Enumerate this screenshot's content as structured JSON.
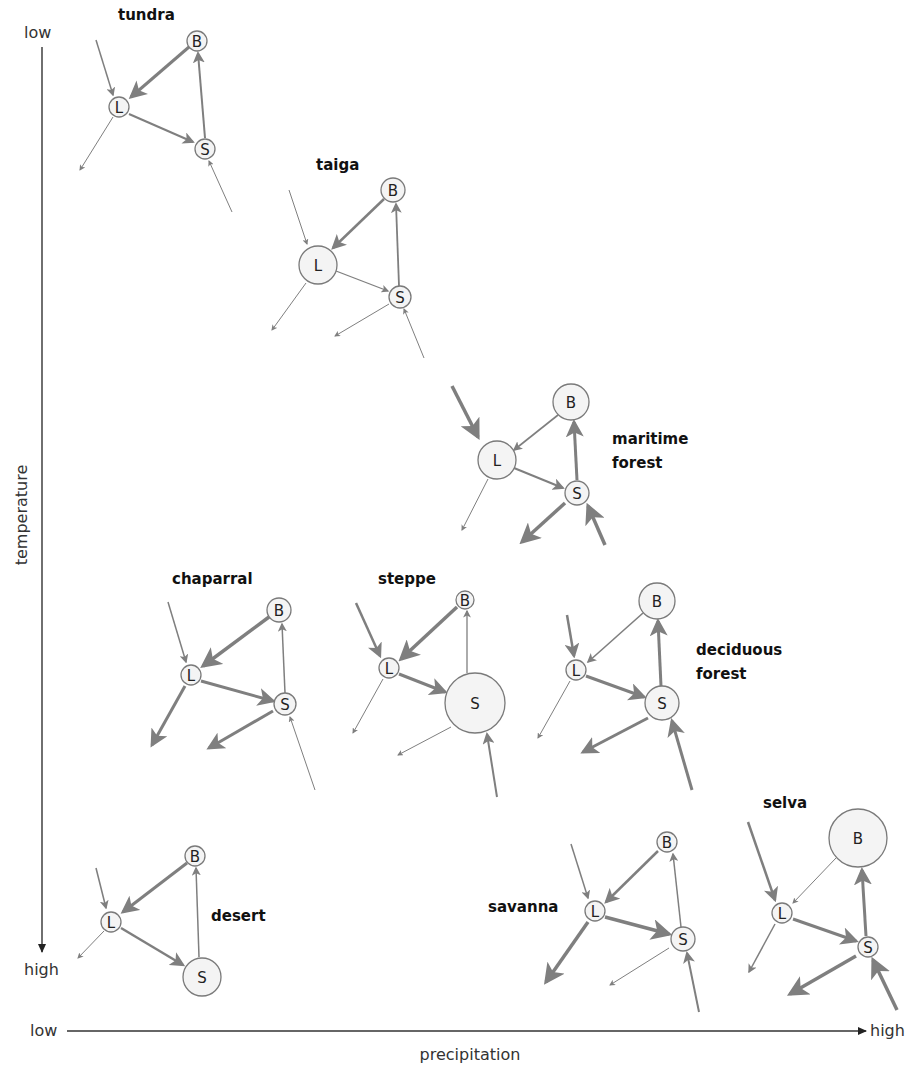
{
  "axes": {
    "y_label": "temperature",
    "y_low": "low",
    "y_high": "high",
    "x_label": "precipitation",
    "x_low": "low",
    "x_high": "high"
  },
  "node_labels": {
    "L": "L",
    "B": "B",
    "S": "S"
  },
  "biomes": [
    {
      "name": "tundra",
      "label": [
        "tundra"
      ],
      "label_pos": [
        118,
        20
      ],
      "nodes": {
        "L": [
          119,
          107,
          10
        ],
        "B": [
          197,
          41,
          10
        ],
        "S": [
          205,
          149,
          10
        ]
      },
      "flows": [
        {
          "from": [
            96,
            40
          ],
          "to": [
            113,
            95
          ],
          "w": 1.5
        },
        {
          "from": [
            189,
            47
          ],
          "to": [
            131,
            97
          ],
          "w": 3
        },
        {
          "from": [
            129,
            114
          ],
          "to": [
            193,
            142
          ],
          "w": 2
        },
        {
          "from": [
            205,
            138
          ],
          "to": [
            198,
            53
          ],
          "w": 2
        },
        {
          "from": [
            113,
            117
          ],
          "to": [
            80,
            170
          ],
          "w": 1
        },
        {
          "from": [
            232,
            212
          ],
          "to": [
            209,
            161
          ],
          "w": 1
        }
      ]
    },
    {
      "name": "taiga",
      "label": [
        "taiga"
      ],
      "label_pos": [
        316,
        170
      ],
      "nodes": {
        "L": [
          318,
          265,
          19
        ],
        "B": [
          393,
          190,
          12
        ],
        "S": [
          400,
          297,
          11
        ]
      },
      "flows": [
        {
          "from": [
            289,
            190
          ],
          "to": [
            307,
            244
          ],
          "w": 1
        },
        {
          "from": [
            384,
            199
          ],
          "to": [
            333,
            248
          ],
          "w": 2.5
        },
        {
          "from": [
            336,
            271
          ],
          "to": [
            388,
            291
          ],
          "w": 1.3
        },
        {
          "from": [
            399,
            286
          ],
          "to": [
            396,
            204
          ],
          "w": 1.8
        },
        {
          "from": [
            306,
            283
          ],
          "to": [
            272,
            330
          ],
          "w": 1
        },
        {
          "from": [
            389,
            304
          ],
          "to": [
            335,
            336
          ],
          "w": 1
        },
        {
          "from": [
            424,
            358
          ],
          "to": [
            404,
            309
          ],
          "w": 1
        }
      ]
    },
    {
      "name": "maritime forest",
      "label": [
        "maritime",
        "forest"
      ],
      "label_pos": [
        612,
        444
      ],
      "nodes": {
        "L": [
          497,
          460,
          19
        ],
        "B": [
          571,
          402,
          18
        ],
        "S": [
          577,
          493,
          12
        ]
      },
      "flows": [
        {
          "from": [
            452,
            386
          ],
          "to": [
            478,
            437
          ],
          "w": 3.5
        },
        {
          "from": [
            558,
            415
          ],
          "to": [
            514,
            450
          ],
          "w": 1.6
        },
        {
          "from": [
            514,
            468
          ],
          "to": [
            563,
            488
          ],
          "w": 2
        },
        {
          "from": [
            577,
            480
          ],
          "to": [
            574,
            422
          ],
          "w": 3
        },
        {
          "from": [
            488,
            479
          ],
          "to": [
            462,
            530
          ],
          "w": 1
        },
        {
          "from": [
            565,
            503
          ],
          "to": [
            522,
            542
          ],
          "w": 3.5
        },
        {
          "from": [
            605,
            545
          ],
          "to": [
            588,
            506
          ],
          "w": 3.5
        }
      ]
    },
    {
      "name": "chaparral",
      "label": [
        "chaparral"
      ],
      "label_pos": [
        172,
        584
      ],
      "nodes": {
        "L": [
          191,
          675,
          10
        ],
        "B": [
          279,
          610,
          12
        ],
        "S": [
          285,
          704,
          11
        ]
      },
      "flows": [
        {
          "from": [
            168,
            602
          ],
          "to": [
            186,
            662
          ],
          "w": 1.5
        },
        {
          "from": [
            269,
            617
          ],
          "to": [
            203,
            666
          ],
          "w": 3.5
        },
        {
          "from": [
            201,
            681
          ],
          "to": [
            273,
            701
          ],
          "w": 3
        },
        {
          "from": [
            285,
            693
          ],
          "to": [
            282,
            624
          ],
          "w": 1.5
        },
        {
          "from": [
            185,
            686
          ],
          "to": [
            152,
            745
          ],
          "w": 3
        },
        {
          "from": [
            273,
            711
          ],
          "to": [
            209,
            748
          ],
          "w": 3
        },
        {
          "from": [
            315,
            790
          ],
          "to": [
            290,
            717
          ],
          "w": 1
        }
      ]
    },
    {
      "name": "steppe",
      "label": [
        "steppe"
      ],
      "label_pos": [
        378,
        584
      ],
      "nodes": {
        "L": [
          389,
          668,
          10
        ],
        "B": [
          465,
          600,
          9
        ],
        "S": [
          475,
          703,
          30
        ]
      },
      "flows": [
        {
          "from": [
            356,
            603
          ],
          "to": [
            380,
            656
          ],
          "w": 2.5
        },
        {
          "from": [
            457,
            607
          ],
          "to": [
            401,
            659
          ],
          "w": 3.5
        },
        {
          "from": [
            399,
            674
          ],
          "to": [
            445,
            692
          ],
          "w": 3
        },
        {
          "from": [
            467,
            673
          ],
          "to": [
            467,
            611
          ],
          "w": 1.3
        },
        {
          "from": [
            383,
            679
          ],
          "to": [
            353,
            733
          ],
          "w": 1
        },
        {
          "from": [
            451,
            727
          ],
          "to": [
            398,
            755
          ],
          "w": 1
        },
        {
          "from": [
            497,
            797
          ],
          "to": [
            487,
            734
          ],
          "w": 2
        }
      ]
    },
    {
      "name": "deciduous forest",
      "label": [
        "deciduous",
        "forest"
      ],
      "label_pos": [
        696,
        655
      ],
      "nodes": {
        "L": [
          576,
          670,
          10
        ],
        "B": [
          657,
          601,
          18
        ],
        "S": [
          662,
          703,
          17
        ]
      },
      "flows": [
        {
          "from": [
            567,
            615
          ],
          "to": [
            574,
            656
          ],
          "w": 2.5
        },
        {
          "from": [
            643,
            613
          ],
          "to": [
            588,
            662
          ],
          "w": 1.6
        },
        {
          "from": [
            586,
            676
          ],
          "to": [
            644,
            697
          ],
          "w": 3
        },
        {
          "from": [
            661,
            686
          ],
          "to": [
            658,
            621
          ],
          "w": 3
        },
        {
          "from": [
            570,
            681
          ],
          "to": [
            538,
            738
          ],
          "w": 1
        },
        {
          "from": [
            648,
            718
          ],
          "to": [
            583,
            752
          ],
          "w": 3
        },
        {
          "from": [
            692,
            790
          ],
          "to": [
            672,
            721
          ],
          "w": 3
        }
      ]
    },
    {
      "name": "desert",
      "label": [
        "desert"
      ],
      "label_pos": [
        211,
        921
      ],
      "nodes": {
        "L": [
          111,
          922,
          10
        ],
        "B": [
          195,
          856,
          10
        ],
        "S": [
          202,
          977,
          19
        ]
      },
      "flows": [
        {
          "from": [
            96,
            868
          ],
          "to": [
            106,
            908
          ],
          "w": 1.5
        },
        {
          "from": [
            187,
            863
          ],
          "to": [
            123,
            912
          ],
          "w": 3
        },
        {
          "from": [
            121,
            928
          ],
          "to": [
            183,
            965
          ],
          "w": 2.5
        },
        {
          "from": [
            199,
            957
          ],
          "to": [
            196,
            868
          ],
          "w": 1.5
        },
        {
          "from": [
            104,
            931
          ],
          "to": [
            78,
            958
          ],
          "w": 1
        }
      ]
    },
    {
      "name": "savanna",
      "label": [
        "savanna"
      ],
      "label_pos": [
        488,
        912
      ],
      "nodes": {
        "L": [
          595,
          911,
          10
        ],
        "B": [
          667,
          842,
          10
        ],
        "S": [
          683,
          939,
          12
        ]
      },
      "flows": [
        {
          "from": [
            571,
            844
          ],
          "to": [
            588,
            898
          ],
          "w": 1.5
        },
        {
          "from": [
            658,
            851
          ],
          "to": [
            606,
            902
          ],
          "w": 2.5
        },
        {
          "from": [
            605,
            917
          ],
          "to": [
            669,
            934
          ],
          "w": 3.5
        },
        {
          "from": [
            681,
            927
          ],
          "to": [
            673,
            854
          ],
          "w": 1.5
        },
        {
          "from": [
            588,
            922
          ],
          "to": [
            546,
            982
          ],
          "w": 3.5
        },
        {
          "from": [
            669,
            948
          ],
          "to": [
            610,
            985
          ],
          "w": 1
        },
        {
          "from": [
            699,
            1012
          ],
          "to": [
            687,
            953
          ],
          "w": 2
        }
      ]
    },
    {
      "name": "selva",
      "label": [
        "selva"
      ],
      "label_pos": [
        763,
        808
      ],
      "nodes": {
        "L": [
          782,
          913,
          10
        ],
        "B": [
          858,
          838,
          29
        ],
        "S": [
          868,
          947,
          10
        ]
      },
      "flows": [
        {
          "from": [
            748,
            822
          ],
          "to": [
            775,
            900
          ],
          "w": 2.5
        },
        {
          "from": [
            836,
            858
          ],
          "to": [
            793,
            903
          ],
          "w": 1
        },
        {
          "from": [
            793,
            919
          ],
          "to": [
            856,
            941
          ],
          "w": 3
        },
        {
          "from": [
            866,
            936
          ],
          "to": [
            862,
            870
          ],
          "w": 3
        },
        {
          "from": [
            775,
            924
          ],
          "to": [
            749,
            972
          ],
          "w": 1.5
        },
        {
          "from": [
            856,
            956
          ],
          "to": [
            790,
            994
          ],
          "w": 3.5
        },
        {
          "from": [
            897,
            1010
          ],
          "to": [
            873,
            960
          ],
          "w": 3.5
        }
      ]
    }
  ],
  "colors": {
    "arrow": "#7f7f7f",
    "node_fill": "#f4f4f4",
    "node_stroke": "#7a7a7a",
    "text": "#111111"
  }
}
